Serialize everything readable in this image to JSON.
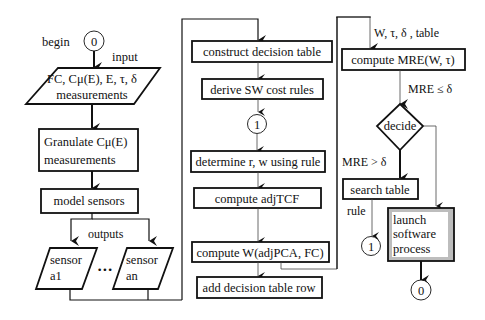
{
  "diagram": {
    "type": "flowchart",
    "columns": 3,
    "labels": {
      "begin": "begin",
      "input": "input",
      "outputs": "outputs",
      "ellipsis": "•••",
      "w_tau_delta_table": "W, τ, δ , table",
      "mre_le_delta": "MRE ≤ δ",
      "mre_gt_delta": "MRE > δ",
      "rule": "rule"
    },
    "connectors": {
      "start": "0",
      "rule_loop_a": "1",
      "rule_loop_b": "1",
      "end": "0"
    },
    "column1": {
      "input_line1": "FC, Cμ(E), E, τ, δ",
      "input_line2": "measurements",
      "granulate_line1": "Granulate Cμ(E)",
      "granulate_line2": "measurements",
      "model_sensors": "model sensors",
      "sensor_a1_line1": "sensor",
      "sensor_a1_line2": "a1",
      "sensor_an_line1": "sensor",
      "sensor_an_line2": "an"
    },
    "column2": {
      "construct": "construct decision table",
      "derive": "derive SW cost rules",
      "determine": "determine r, w using rule",
      "compute_adj": "compute adjTCF",
      "compute_w": "compute W(adjPCA, FC)",
      "add_row": "add decision table row"
    },
    "column3": {
      "compute_mre": "compute MRE(W, τ)",
      "decide": "decide",
      "search": "search table",
      "launch_line1": "launch",
      "launch_line2": "software",
      "launch_line3": "process"
    },
    "colors": {
      "stroke": "#111111",
      "background": "#ffffff",
      "launch_shadow": "#bdbdbd"
    }
  }
}
